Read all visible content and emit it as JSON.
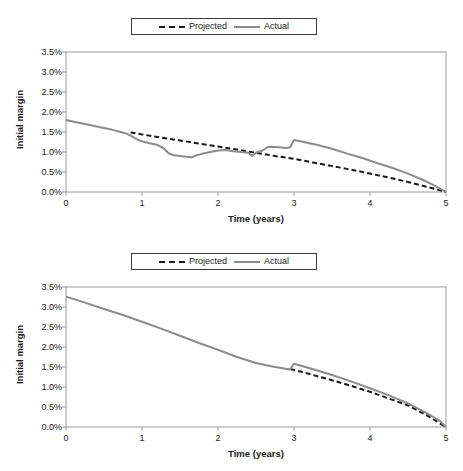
{
  "figure": {
    "panel_count": 2,
    "background_color": "#ffffff"
  },
  "legend": {
    "entries": [
      {
        "label": "Projected",
        "style": "dashed",
        "color": "#1a1a1a"
      },
      {
        "label": "Actual",
        "style": "solid",
        "color": "#8c8c8c"
      }
    ],
    "border_color": "#3a3a3a",
    "position": "top-center"
  },
  "axes": {
    "ylabel": "Initial margin",
    "xlabel": "Time (years)",
    "yticks": [
      "0.0%",
      "0.5%",
      "1.0%",
      "1.5%",
      "2.0%",
      "2.5%",
      "3.0%",
      "3.5%"
    ],
    "xticks": [
      "0",
      "1",
      "2",
      "3",
      "4",
      "5"
    ],
    "axis_color": "#9a9a9a"
  },
  "chart_data": [
    {
      "type": "line",
      "panel": "top",
      "title": "",
      "xlabel": "Time (years)",
      "ylabel": "Initial margin",
      "xlim": [
        0,
        5
      ],
      "ylim": [
        0,
        3.5
      ],
      "y_unit": "percent",
      "grid": false,
      "legend_position": "top-center",
      "series": [
        {
          "name": "Projected",
          "style": "dashed",
          "color": "#1a1a1a",
          "x": [
            0.85,
            1.0,
            1.25,
            1.5,
            1.75,
            2.0,
            2.25,
            2.5,
            2.75,
            3.0,
            3.25,
            3.5,
            3.75,
            4.0,
            4.25,
            4.5,
            4.75,
            5.0
          ],
          "y": [
            1.49,
            1.44,
            1.36,
            1.29,
            1.21,
            1.14,
            1.06,
            0.98,
            0.9,
            0.83,
            0.74,
            0.65,
            0.56,
            0.46,
            0.36,
            0.25,
            0.13,
            0.0
          ]
        },
        {
          "name": "Actual",
          "style": "solid",
          "color": "#8c8c8c",
          "x": [
            0.0,
            0.15,
            0.3,
            0.45,
            0.6,
            0.72,
            0.8,
            0.88,
            0.95,
            1.0,
            1.1,
            1.2,
            1.28,
            1.35,
            1.42,
            1.5,
            1.58,
            1.65,
            1.72,
            1.8,
            1.9,
            2.0,
            2.1,
            2.2,
            2.3,
            2.4,
            2.45,
            2.5,
            2.6,
            2.65,
            2.7,
            2.8,
            2.9,
            2.95,
            3.0,
            3.1,
            3.2,
            3.3,
            3.5,
            3.7,
            3.9,
            4.1,
            4.3,
            4.5,
            4.7,
            4.85,
            5.0
          ],
          "y": [
            1.8,
            1.74,
            1.68,
            1.62,
            1.56,
            1.5,
            1.46,
            1.38,
            1.3,
            1.27,
            1.22,
            1.18,
            1.1,
            0.97,
            0.92,
            0.9,
            0.88,
            0.87,
            0.92,
            0.96,
            1.0,
            1.04,
            1.05,
            1.02,
            1.0,
            0.98,
            0.9,
            0.98,
            1.05,
            1.12,
            1.13,
            1.12,
            1.1,
            1.12,
            1.3,
            1.26,
            1.22,
            1.18,
            1.08,
            0.96,
            0.85,
            0.72,
            0.6,
            0.46,
            0.3,
            0.16,
            0.0
          ]
        }
      ],
      "annotations": [
        {
          "text": "Projected line begins at approx. t=0.85",
          "x": 0.85
        },
        {
          "text": "Actual dips to trough ~0.87% near t=1.65",
          "x": 1.65
        },
        {
          "text": "Step increase in Actual at t=3.0 up to ~1.30%",
          "x": 3.0
        }
      ]
    },
    {
      "type": "line",
      "panel": "bottom",
      "title": "",
      "xlabel": "Time (years)",
      "ylabel": "Initial margin",
      "xlim": [
        0,
        5
      ],
      "ylim": [
        0,
        3.5
      ],
      "y_unit": "percent",
      "grid": false,
      "legend_position": "top-center",
      "series": [
        {
          "name": "Projected",
          "style": "dashed",
          "color": "#1a1a1a",
          "x": [
            2.95,
            3.1,
            3.25,
            3.5,
            3.75,
            4.0,
            4.25,
            4.5,
            4.75,
            5.0
          ],
          "y": [
            1.45,
            1.38,
            1.3,
            1.17,
            1.03,
            0.88,
            0.71,
            0.54,
            0.29,
            0.0
          ]
        },
        {
          "name": "Actual",
          "style": "solid",
          "color": "#8c8c8c",
          "x": [
            0.0,
            0.25,
            0.5,
            0.75,
            1.0,
            1.25,
            1.5,
            1.75,
            2.0,
            2.25,
            2.5,
            2.7,
            2.85,
            2.95,
            3.0,
            3.15,
            3.3,
            3.5,
            3.75,
            4.0,
            4.25,
            4.5,
            4.75,
            4.9,
            5.0
          ],
          "y": [
            3.26,
            3.11,
            2.95,
            2.8,
            2.63,
            2.46,
            2.28,
            2.1,
            1.93,
            1.75,
            1.6,
            1.52,
            1.47,
            1.44,
            1.58,
            1.5,
            1.42,
            1.3,
            1.14,
            0.97,
            0.79,
            0.59,
            0.34,
            0.18,
            0.0
          ]
        }
      ],
      "annotations": [
        {
          "text": "Projected line begins at approx. t=2.95",
          "x": 2.95
        },
        {
          "text": "Small step increase in Actual at t=3.0 to ~1.58%",
          "x": 3.0
        }
      ]
    }
  ]
}
